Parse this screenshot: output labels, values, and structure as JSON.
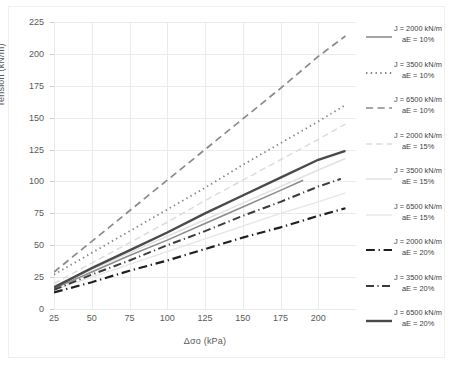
{
  "chart_data": {
    "type": "line",
    "title": "",
    "xlabel": "Δσo (kPa)",
    "ylabel": "Tension (kN/m)",
    "xlim": [
      25,
      225
    ],
    "ylim": [
      0,
      225
    ],
    "xticks": [
      25,
      50,
      75,
      100,
      125,
      150,
      175,
      200
    ],
    "yticks": [
      0,
      25,
      50,
      75,
      100,
      125,
      150,
      175,
      200,
      225
    ],
    "grid": true,
    "legend_position": "right",
    "series": [
      {
        "name": "J = 2000 kN/m aE = 10%",
        "label_line1": "J = 2000 kN/m",
        "label_line2": "aE = 10%",
        "style": "solid",
        "color": "#8c8c8c",
        "width": 1.6,
        "x": [
          25,
          50,
          75,
          100,
          125,
          150,
          175,
          190
        ],
        "y": [
          16,
          29,
          42,
          54,
          67,
          80,
          93,
          101
        ]
      },
      {
        "name": "J = 3500 kN/m aE = 10%",
        "label_line1": "J = 3500 kN/m",
        "label_line2": "aE = 10%",
        "style": "dotted",
        "color": "#808080",
        "width": 1.8,
        "x": [
          25,
          50,
          75,
          100,
          125,
          150,
          175,
          200,
          218
        ],
        "y": [
          27,
          44,
          61,
          78,
          95,
          113,
          130,
          147,
          160
        ]
      },
      {
        "name": "J = 6500 kN/m aE = 10%",
        "label_line1": "J = 6500 kN/m",
        "label_line2": "aE = 10%",
        "style": "dashed",
        "color": "#8a8a8a",
        "width": 1.7,
        "x": [
          25,
          50,
          75,
          100,
          125,
          150,
          175,
          200,
          218
        ],
        "y": [
          29,
          53,
          77,
          101,
          125,
          149,
          173,
          198,
          214
        ]
      },
      {
        "name": "J = 2000 kN/m aE = 15%",
        "label_line1": "J = 2000 kN/m",
        "label_line2": "aE = 15%",
        "style": "dashed",
        "color": "#dcdcdc",
        "width": 1.5,
        "x": [
          25,
          50,
          75,
          100,
          125,
          150,
          175,
          200,
          218
        ],
        "y": [
          20,
          36,
          52,
          68,
          85,
          101,
          117,
          133,
          145
        ]
      },
      {
        "name": "J = 3500 kN/m aE = 15%",
        "label_line1": "J = 3500 kN/m",
        "label_line2": "aE = 15%",
        "style": "solid",
        "color": "#e2e2e2",
        "width": 1.5,
        "x": [
          25,
          50,
          75,
          100,
          125,
          150,
          175,
          200,
          218
        ],
        "y": [
          18,
          31,
          44,
          57,
          70,
          83,
          96,
          109,
          118
        ]
      },
      {
        "name": "J = 6500 kN/m aE = 15%",
        "label_line1": "J = 6500 kN/m",
        "label_line2": "aE = 15%",
        "style": "solid",
        "color": "#e6e6e6",
        "width": 1.4,
        "x": [
          25,
          50,
          75,
          100,
          125,
          150,
          175,
          200,
          218
        ],
        "y": [
          15,
          25,
          35,
          45,
          55,
          65,
          75,
          84,
          91
        ]
      },
      {
        "name": "J = 2000 kN/m aE = 20%",
        "label_line1": "J = 2000 kN/m",
        "label_line2": "aE = 20%",
        "style": "dashdot",
        "color": "#1f1f1f",
        "width": 2.2,
        "x": [
          25,
          50,
          75,
          100,
          125,
          150,
          175,
          200,
          218
        ],
        "y": [
          13,
          21,
          30,
          38,
          47,
          56,
          64,
          73,
          79
        ]
      },
      {
        "name": "J = 3500 kN/m aE = 20%",
        "label_line1": "J = 3500 kN/m",
        "label_line2": "aE = 20%",
        "style": "dashdot",
        "color": "#3a3a3a",
        "width": 2.0,
        "x": [
          25,
          50,
          75,
          100,
          125,
          150,
          175,
          200,
          215
        ],
        "y": [
          15,
          27,
          38,
          50,
          61,
          73,
          84,
          96,
          102
        ]
      },
      {
        "name": "J = 6500 kN/m aE = 20%",
        "label_line1": "J = 6500 kN/m",
        "label_line2": "aE = 20%",
        "style": "solid",
        "color": "#4a4a4a",
        "width": 2.4,
        "x": [
          25,
          50,
          75,
          100,
          125,
          150,
          175,
          200,
          218
        ],
        "y": [
          17,
          32,
          46,
          60,
          75,
          89,
          103,
          117,
          124
        ]
      }
    ]
  },
  "axes": {
    "xlabel": "Δσo (kPa)",
    "ylabel": "Tension (kN/m)",
    "xticks": [
      "25",
      "50",
      "75",
      "100",
      "125",
      "150",
      "175",
      "200"
    ],
    "yticks": [
      "0",
      "25",
      "50",
      "75",
      "100",
      "125",
      "150",
      "175",
      "200",
      "225"
    ]
  }
}
